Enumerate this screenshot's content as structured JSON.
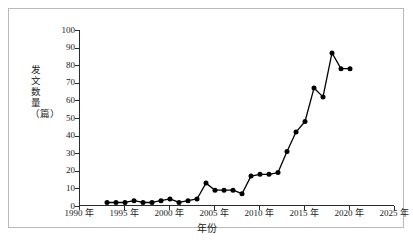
{
  "chart_data": {
    "type": "line",
    "title": "",
    "subtitle": "",
    "xlabel": "年份",
    "ylabel": "发文数量（篇）",
    "xlim": [
      1990,
      2025
    ],
    "ylim": [
      0,
      100
    ],
    "xticks": [
      1990,
      1995,
      2000,
      2005,
      2010,
      2015,
      2020,
      2025
    ],
    "xtick_labels": [
      "1990 年",
      "1995 年",
      "2000 年",
      "2005 年",
      "2010 年",
      "2015 年",
      "2020 年",
      "2025 年"
    ],
    "yticks": [
      0,
      10,
      20,
      30,
      40,
      50,
      60,
      70,
      80,
      90,
      100
    ],
    "ytick_labels": [
      "0",
      "10",
      "20",
      "30",
      "40",
      "50",
      "60",
      "70",
      "80",
      "90",
      "100"
    ],
    "grid": false,
    "legend": false,
    "legend_position": "none",
    "marker": "filled-circle",
    "line_color": "#000000",
    "marker_color": "#000000",
    "x": [
      1993,
      1994,
      1995,
      1996,
      1997,
      1998,
      1999,
      2000,
      2001,
      2002,
      2003,
      2004,
      2005,
      2006,
      2007,
      2008,
      2009,
      2010,
      2011,
      2012,
      2013,
      2014,
      2015,
      2016,
      2017,
      2018,
      2019,
      2020
    ],
    "values": [
      2,
      2,
      2,
      3,
      2,
      2,
      3,
      4,
      2,
      3,
      4,
      13,
      9,
      9,
      9,
      7,
      17,
      18,
      18,
      19,
      31,
      42,
      48,
      67,
      62,
      87,
      78,
      78
    ],
    "series": [
      {
        "name": "发文数量（篇）",
        "x": [
          1993,
          1994,
          1995,
          1996,
          1997,
          1998,
          1999,
          2000,
          2001,
          2002,
          2003,
          2004,
          2005,
          2006,
          2007,
          2008,
          2009,
          2010,
          2011,
          2012,
          2013,
          2014,
          2015,
          2016,
          2017,
          2018,
          2019
        ],
        "values": [
          2,
          2,
          2,
          3,
          2,
          2,
          3,
          4,
          2,
          3,
          4,
          13,
          9,
          9,
          9,
          7,
          17,
          18,
          18,
          19,
          31,
          42,
          48,
          67,
          62,
          87,
          78
        ]
      }
    ],
    "annotations": []
  },
  "axes": {
    "y_title": "发文数量（篇）",
    "x_title": "年份"
  },
  "caption": {
    "text": ""
  }
}
